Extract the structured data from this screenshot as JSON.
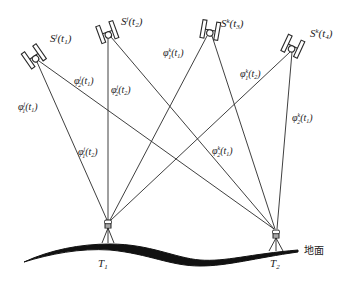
{
  "diagram": {
    "type": "satellite-receiver double-difference geometry",
    "satellites": [
      {
        "id": "Sj_t1",
        "label_base": "S",
        "label_sup": "j",
        "label_arg": "(t",
        "label_sub": "1",
        "label_close": ")",
        "x": 35,
        "y": 58,
        "angle": -35
      },
      {
        "id": "Sj_t2",
        "label_base": "S",
        "label_sup": "j",
        "label_arg": "(t",
        "label_sub": "2",
        "label_close": ")",
        "x": 108,
        "y": 34,
        "angle": -20
      },
      {
        "id": "Sk_t3",
        "label_base": "S",
        "label_sup": "k",
        "label_arg": "(t",
        "label_sub": "3",
        "label_close": ")",
        "x": 210,
        "y": 32,
        "angle": 10
      },
      {
        "id": "Sk_t4",
        "label_base": "S",
        "label_sup": "k",
        "label_arg": "(t",
        "label_sub": "4",
        "label_close": ")",
        "x": 292,
        "y": 48,
        "angle": 25
      }
    ],
    "receivers": [
      {
        "id": "T1",
        "label_base": "T",
        "label_sub": "1",
        "x": 108,
        "y": 228
      },
      {
        "id": "T2",
        "label_base": "T",
        "label_sub": "2",
        "x": 276,
        "y": 238
      }
    ],
    "observations": [
      {
        "label": "φ₁ʲ(t₁)",
        "base": "φ",
        "sub": "1",
        "sup": "j",
        "arg": "(t",
        "argsub": "1",
        "x": 18,
        "y": 108
      },
      {
        "label": "φ₂ʲ(t₁)",
        "base": "φ",
        "sub": "2",
        "sup": "j",
        "arg": "(t",
        "argsub": "1",
        "x": 74,
        "y": 83
      },
      {
        "label": "φ₂ʲ(t₂)",
        "base": "φ",
        "sub": "2",
        "sup": "j",
        "arg": "(t",
        "argsub": "2",
        "x": 111,
        "y": 92
      },
      {
        "label": "φ₁ʲ(t₂)",
        "base": "φ",
        "sub": "1",
        "sup": "j",
        "arg": "(t",
        "argsub": "2",
        "x": 78,
        "y": 153
      },
      {
        "label": "φ₁ᵏ(t₁)",
        "base": "φ",
        "sub": "1",
        "sup": "k",
        "arg": "(t",
        "argsub": "1",
        "x": 164,
        "y": 55
      },
      {
        "label": "φ₁ᵏ(t₂)",
        "base": "φ",
        "sub": "1",
        "sup": "k",
        "arg": "(t",
        "argsub": "2",
        "x": 240,
        "y": 76
      },
      {
        "label": "φ₂ᵏ(t₁)",
        "base": "φ",
        "sub": "2",
        "sup": "k",
        "arg": "(t",
        "argsub": "1",
        "x": 212,
        "y": 153
      },
      {
        "label": "φ₂ᵏ(t₁)",
        "base": "φ",
        "sub": "2",
        "sup": "k",
        "arg": "(t",
        "argsub": "1",
        "x": 292,
        "y": 120
      }
    ],
    "ground_label": "地面"
  }
}
